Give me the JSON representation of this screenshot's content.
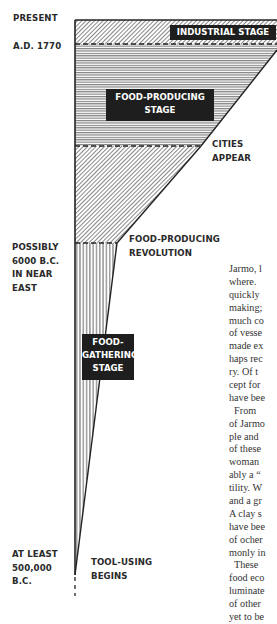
{
  "time_labels": {
    "present": "PRESENT",
    "ad1770": "A.D. 1770",
    "bc6000": [
      "POSSIBLY",
      "6000 B.C.",
      "IN NEAR",
      "EAST"
    ],
    "bc500000": [
      "AT LEAST",
      "500,000",
      "B.C."
    ]
  },
  "event_labels": {
    "cities": [
      "CITIES",
      "APPEAR"
    ],
    "revolution": [
      "FOOD-PRODUCING",
      "REVOLUTION"
    ],
    "tools": [
      "TOOL-USING",
      "BEGINS"
    ]
  },
  "stages": {
    "industrial": "INDUSTRIAL STAGE",
    "food_producing": [
      "FOOD-PRODUCING",
      "STAGE"
    ],
    "food_gathering": [
      "FOOD-",
      "GATHERING",
      "STAGE"
    ]
  },
  "body_text": [
    "Jarmo, l",
    "where.",
    "quickly",
    "making;",
    "much co",
    "of vesse",
    "made ex",
    "haps rec",
    "ry. Of t",
    "cept for",
    "have bee",
    "  From",
    "of Jarmo",
    "ple and",
    "of these",
    "woman",
    "ably a “",
    "tility. W",
    "and a gr",
    "A clay s",
    "have bee",
    "of ocher",
    "monly in",
    "  These",
    "food eco",
    "luminate",
    "of other",
    "yet to be"
  ]
}
